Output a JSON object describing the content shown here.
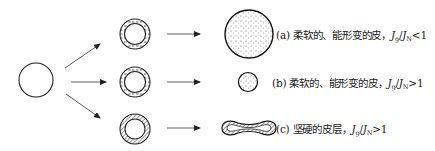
{
  "diagram": {
    "type": "process-flow",
    "nodes": {
      "start": {
        "shape": "circle",
        "description": "initial droplet"
      },
      "rows": [
        {
          "id": "a",
          "intermediate": {
            "shape": "ring",
            "fill": "dashed-skin"
          },
          "result": {
            "shape": "large-circle",
            "fill": "dotted"
          },
          "label": {
            "prefix": "(a) 柔软的、能形变的皮，",
            "var1": "J",
            "sub1": "g",
            "sep": "/",
            "var2": "J",
            "sub2": "N",
            "relation": "<1"
          }
        },
        {
          "id": "b",
          "intermediate": {
            "shape": "ring",
            "fill": "dashed-skin"
          },
          "result": {
            "shape": "small-circle",
            "fill": "dotted"
          },
          "label": {
            "prefix": "(b) 柔软的、能形变的皮，",
            "var1": "J",
            "sub1": "g",
            "sep": "/",
            "var2": "J",
            "sub2": "N",
            "relation": ">1"
          }
        },
        {
          "id": "c",
          "intermediate": {
            "shape": "ring",
            "fill": "hatched-skin"
          },
          "result": {
            "shape": "collapsed-dumbbell",
            "fill": "hatched"
          },
          "label": {
            "prefix": "(c) 坚硬的皮层，",
            "var1": "J",
            "sub1": "g",
            "sep": "/",
            "var2": "J",
            "sub2": "N",
            "relation": ">1"
          }
        }
      ]
    },
    "colors": {
      "stroke": "#222222",
      "background": "#ffffff"
    }
  }
}
